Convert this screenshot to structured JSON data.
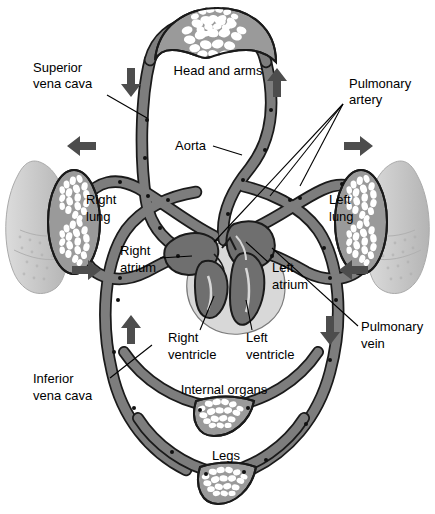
{
  "figure": {
    "background_color": "#ffffff"
  },
  "colors": {
    "vessel_fill": "#7d7d7d",
    "vessel_stroke": "#1a1a1a",
    "capillary_fill": "#9a9a9a",
    "lung_body_fill": "#c9c9c9",
    "heart_muscle_fill": "#d8d8d8",
    "heart_chamber_fill": "#6f6f6f",
    "arrow_fill": "#4d4d4d",
    "text_color": "#000000",
    "leader_line_color": "#000000"
  },
  "labels": {
    "head_and_arms": "Head and arms",
    "superior_vena_cava_line1": "Superior",
    "superior_vena_cava_line2": "vena cava",
    "pulmonary_artery_line1": "Pulmonary",
    "pulmonary_artery_line2": "artery",
    "aorta": "Aorta",
    "right_lung_line1": "Right",
    "right_lung_line2": "lung",
    "left_lung_line1": "Left",
    "left_lung_line2": "lung",
    "right_atrium_line1": "Right",
    "right_atrium_line2": "atrium",
    "left_atrium_line1": "Left",
    "left_atrium_line2": "atrium",
    "right_ventricle_line1": "Right",
    "right_ventricle_line2": "ventricle",
    "left_ventricle_line1": "Left",
    "left_ventricle_line2": "ventricle",
    "pulmonary_vein_line1": "Pulmonary",
    "pulmonary_vein_line2": "vein",
    "inferior_vena_cava_line1": "Inferior",
    "inferior_vena_cava_line2": "vena cava",
    "internal_organs": "Internal organs",
    "legs": "Legs"
  },
  "flow_arrows": [
    {
      "name": "head-down-arrow",
      "direction": "down",
      "x": 131,
      "y": 82,
      "meaning": "blood descending from head in superior vena cava"
    },
    {
      "name": "head-up-arrow",
      "direction": "up",
      "x": 277,
      "y": 82,
      "meaning": "blood ascending to head in aorta"
    },
    {
      "name": "right-lung-out-arrow",
      "direction": "left",
      "x": 82,
      "y": 146,
      "meaning": "blood flowing toward right lung"
    },
    {
      "name": "left-lung-out-arrow",
      "direction": "right",
      "x": 356,
      "y": 146,
      "meaning": "blood flowing toward left lung"
    },
    {
      "name": "right-lung-return-arrow",
      "direction": "right",
      "x": 85,
      "y": 270,
      "meaning": "blood returning from right lung"
    },
    {
      "name": "left-lung-return-arrow",
      "direction": "left",
      "x": 353,
      "y": 270,
      "meaning": "blood returning from left lung"
    },
    {
      "name": "body-return-arrow",
      "direction": "up",
      "x": 131,
      "y": 330,
      "meaning": "blood returning up the inferior vena cava"
    },
    {
      "name": "body-out-arrow",
      "direction": "down",
      "x": 330,
      "y": 330,
      "meaning": "blood leaving heart down the aorta"
    }
  ],
  "capillary_beds": [
    {
      "name": "head-and-arms-capillary-bed",
      "label": "Head and arms"
    },
    {
      "name": "right-lung-capillary-bed",
      "label": "Right lung"
    },
    {
      "name": "left-lung-capillary-bed",
      "label": "Left lung"
    },
    {
      "name": "internal-organs-capillary-bed",
      "label": "Internal organs"
    },
    {
      "name": "legs-capillary-bed",
      "label": "Legs"
    }
  ],
  "heart_parts": [
    {
      "name": "right-atrium",
      "label": "Right atrium"
    },
    {
      "name": "left-atrium",
      "label": "Left atrium"
    },
    {
      "name": "right-ventricle",
      "label": "Right ventricle"
    },
    {
      "name": "left-ventricle",
      "label": "Left ventricle"
    }
  ],
  "vessels": [
    {
      "name": "superior-vena-cava",
      "label": "Superior vena cava"
    },
    {
      "name": "inferior-vena-cava",
      "label": "Inferior vena cava"
    },
    {
      "name": "aorta",
      "label": "Aorta"
    },
    {
      "name": "pulmonary-artery",
      "label": "Pulmonary artery"
    },
    {
      "name": "pulmonary-vein",
      "label": "Pulmonary vein"
    }
  ]
}
